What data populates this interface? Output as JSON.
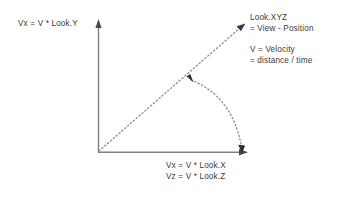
{
  "diagram": {
    "background_color": "#ffffff",
    "axis_color": "#808080",
    "dotted_color": "#8a8a8a",
    "text_color": "#3a3a3a",
    "labels": {
      "y_axis_label": "Vx = V * Look.Y",
      "look_xyz_line1": "Look.XYZ",
      "look_xyz_line2": "= View - Position",
      "velocity_line1": "V = Velocity",
      "velocity_line2": "= distance / time",
      "x_axis_line1": "Vx = V * Look.X",
      "x_axis_line2": "Vz = V * Look.Z"
    },
    "geometry": {
      "origin_x": 98,
      "origin_y": 152,
      "y_axis_tip_x": 99,
      "y_axis_tip_y": 20,
      "x_axis_tip_x": 247,
      "x_axis_tip_y": 152,
      "diagonal_tip_x": 245,
      "diagonal_tip_y": 24,
      "arc_start_x": 188,
      "arc_start_y": 77,
      "arc_end_x": 242,
      "arc_end_y": 152
    }
  }
}
